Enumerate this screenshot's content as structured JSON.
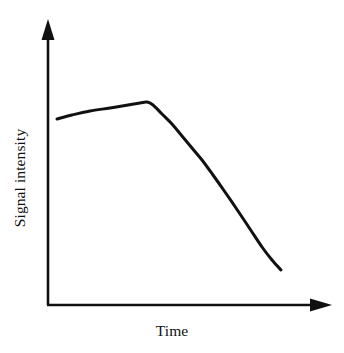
{
  "figure": {
    "background_color": "#ffffff",
    "ink_color": "#111111",
    "width": 344,
    "height": 353
  },
  "axes": {
    "x_axis_name": "time-axis",
    "y_axis_name": "signal-intensity-axis",
    "x_axis_label": "Time",
    "y_axis_label": "Signal intensity",
    "x_axis_has_arrow": true,
    "y_axis_has_arrow": true,
    "tick_marks": "none",
    "tick_labels": "none",
    "origin_px": [
      48,
      305
    ],
    "x_axis_end_px": [
      332,
      305
    ],
    "y_axis_end_px": [
      48,
      19
    ]
  },
  "chart_data": {
    "type": "line",
    "title": "",
    "subtitle": "",
    "xlabel": "Time",
    "ylabel": "Signal intensity",
    "legend": [],
    "legend_position": "none",
    "grid": false,
    "xlim": [
      0,
      1
    ],
    "ylim": [
      0,
      1
    ],
    "axis_ticks_shown": false,
    "annotations": [],
    "series": [
      {
        "name": "signal-decay-curve",
        "color": "#111111",
        "line_width_px": 3,
        "description": "Signal rises slowly to a plateau/peak, then falls with increasing steepness before ending mid-descent.",
        "points_px": [
          [
            57,
            119
          ],
          [
            72,
            115
          ],
          [
            90,
            111
          ],
          [
            110,
            108
          ],
          [
            128,
            105
          ],
          [
            140,
            103
          ],
          [
            147,
            102
          ],
          [
            153,
            105
          ],
          [
            162,
            114
          ],
          [
            172,
            124
          ],
          [
            182,
            136
          ],
          [
            192,
            148
          ],
          [
            202,
            160
          ],
          [
            213,
            175
          ],
          [
            225,
            192
          ],
          [
            238,
            211
          ],
          [
            250,
            229
          ],
          [
            262,
            247
          ],
          [
            272,
            260
          ],
          [
            281,
            270
          ]
        ],
        "x_normalized": [
          0.032,
          0.085,
          0.148,
          0.218,
          0.282,
          0.324,
          0.349,
          0.37,
          0.401,
          0.437,
          0.472,
          0.507,
          0.542,
          0.581,
          0.623,
          0.669,
          0.711,
          0.753,
          0.789,
          0.82
        ],
        "y_normalized": [
          0.651,
          0.664,
          0.678,
          0.689,
          0.699,
          0.706,
          0.71,
          0.699,
          0.668,
          0.633,
          0.591,
          0.549,
          0.507,
          0.455,
          0.395,
          0.329,
          0.266,
          0.203,
          0.158,
          0.122
        ]
      }
    ]
  }
}
